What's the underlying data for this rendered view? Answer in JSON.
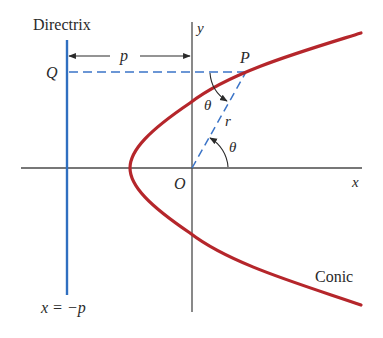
{
  "diagram": {
    "labels": {
      "directrix": "Directrix",
      "y_axis": "y",
      "x_axis": "x",
      "origin": "O",
      "point_q": "Q",
      "point_p": "P",
      "distance_p": "p",
      "radius": "r",
      "theta_top": "θ",
      "theta_bottom": "θ",
      "directrix_equation": "x = −p",
      "curve": "Conic"
    },
    "colors": {
      "conic": "#b5262b",
      "directrix": "#2f6fc0",
      "dashed": "#3b74c7",
      "axes": "#4a4a4a",
      "text": "#2a2a2a"
    },
    "geometry": {
      "origin": [
        192,
        168
      ],
      "directrix_x": 67,
      "vertex": [
        130,
        168
      ],
      "point_P": [
        246,
        72
      ],
      "point_Q": [
        67,
        72
      ]
    }
  }
}
